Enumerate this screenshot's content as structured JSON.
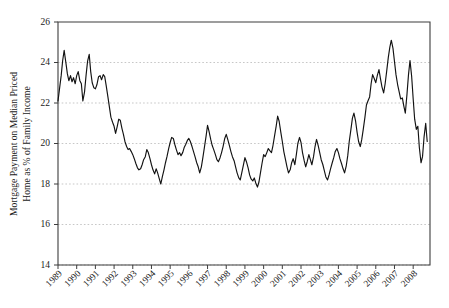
{
  "chart_data": {
    "type": "line",
    "title": "",
    "subtitle": "",
    "xlabel": "",
    "ylabel": "Mortgage Payment on Median Priced Home as % of Family Income",
    "ylabel_line1": "Mortgage Payment on Median Priced",
    "ylabel_line2": "Home as % of Family Income",
    "xlim": [
      1989.0,
      2008.9
    ],
    "ylim": [
      14,
      26
    ],
    "yticks": [
      14,
      16,
      18,
      20,
      22,
      24,
      26
    ],
    "ytick_labels": [
      "14",
      "16",
      "18",
      "20",
      "22",
      "24",
      "26"
    ],
    "xticks": [
      1989,
      1990,
      1991,
      1992,
      1993,
      1994,
      1995,
      1996,
      1997,
      1998,
      1999,
      2000,
      2001,
      2002,
      2003,
      2004,
      2005,
      2006,
      2007,
      2008
    ],
    "xtick_labels": [
      "1989",
      "1990",
      "1991",
      "1992",
      "1993",
      "1994",
      "1995",
      "1996",
      "1997",
      "1998",
      "1999",
      "2000",
      "2001",
      "2002",
      "2003",
      "2004",
      "2005",
      "2006",
      "2007",
      "2008"
    ],
    "grid": true,
    "grid_axis": "y",
    "legend": false,
    "legend_position": "none",
    "line_color": "#121212",
    "grid_color": "#b9b9b9",
    "axis_color": "#3d3d3d",
    "series": [
      {
        "name": "Mortgage Payment on Median Priced Home as % of Family Income",
        "x": [
          1989.0,
          1989.08,
          1989.17,
          1989.25,
          1989.33,
          1989.42,
          1989.5,
          1989.58,
          1989.67,
          1989.75,
          1989.83,
          1989.92,
          1990.0,
          1990.08,
          1990.17,
          1990.25,
          1990.33,
          1990.42,
          1990.5,
          1990.58,
          1990.67,
          1990.75,
          1990.83,
          1990.92,
          1991.0,
          1991.08,
          1991.17,
          1991.25,
          1991.33,
          1991.42,
          1991.5,
          1991.58,
          1991.67,
          1991.75,
          1991.83,
          1991.92,
          1992.0,
          1992.08,
          1992.17,
          1992.25,
          1992.33,
          1992.42,
          1992.5,
          1992.58,
          1992.67,
          1992.75,
          1992.83,
          1992.92,
          1993.0,
          1993.08,
          1993.17,
          1993.25,
          1993.33,
          1993.42,
          1993.5,
          1993.58,
          1993.67,
          1993.75,
          1993.83,
          1993.92,
          1994.0,
          1994.08,
          1994.17,
          1994.25,
          1994.33,
          1994.42,
          1994.5,
          1994.58,
          1994.67,
          1994.75,
          1994.83,
          1994.92,
          1995.0,
          1995.08,
          1995.17,
          1995.25,
          1995.33,
          1995.42,
          1995.5,
          1995.58,
          1995.67,
          1995.75,
          1995.83,
          1995.92,
          1996.0,
          1996.08,
          1996.17,
          1996.25,
          1996.33,
          1996.42,
          1996.5,
          1996.58,
          1996.67,
          1996.75,
          1996.83,
          1996.92,
          1997.0,
          1997.08,
          1997.17,
          1997.25,
          1997.33,
          1997.42,
          1997.5,
          1997.58,
          1997.67,
          1997.75,
          1997.83,
          1997.92,
          1998.0,
          1998.08,
          1998.17,
          1998.25,
          1998.33,
          1998.42,
          1998.5,
          1998.58,
          1998.67,
          1998.75,
          1998.83,
          1998.92,
          1999.0,
          1999.08,
          1999.17,
          1999.25,
          1999.33,
          1999.42,
          1999.5,
          1999.58,
          1999.67,
          1999.75,
          1999.83,
          1999.92,
          2000.0,
          2000.08,
          2000.17,
          2000.25,
          2000.33,
          2000.42,
          2000.5,
          2000.58,
          2000.67,
          2000.75,
          2000.83,
          2000.92,
          2001.0,
          2001.08,
          2001.17,
          2001.25,
          2001.33,
          2001.42,
          2001.5,
          2001.58,
          2001.67,
          2001.75,
          2001.83,
          2001.92,
          2002.0,
          2002.08,
          2002.17,
          2002.25,
          2002.33,
          2002.42,
          2002.5,
          2002.58,
          2002.67,
          2002.75,
          2002.83,
          2002.92,
          2003.0,
          2003.08,
          2003.17,
          2003.25,
          2003.33,
          2003.42,
          2003.5,
          2003.58,
          2003.67,
          2003.75,
          2003.83,
          2003.92,
          2004.0,
          2004.08,
          2004.17,
          2004.25,
          2004.33,
          2004.42,
          2004.5,
          2004.58,
          2004.67,
          2004.75,
          2004.83,
          2004.92,
          2005.0,
          2005.08,
          2005.17,
          2005.25,
          2005.33,
          2005.42,
          2005.5,
          2005.58,
          2005.67,
          2005.75,
          2005.83,
          2005.92,
          2006.0,
          2006.08,
          2006.17,
          2006.25,
          2006.33,
          2006.42,
          2006.5,
          2006.58,
          2006.67,
          2006.75,
          2006.83,
          2006.92,
          2007.0,
          2007.08,
          2007.17,
          2007.25,
          2007.33,
          2007.42,
          2007.5,
          2007.58,
          2007.67,
          2007.75,
          2007.83,
          2007.92,
          2008.0,
          2008.08,
          2008.17,
          2008.25,
          2008.33,
          2008.42,
          2008.5,
          2008.58,
          2008.67,
          2008.75
        ],
        "values": [
          22.1,
          22.7,
          23.35,
          24.1,
          24.6,
          24.0,
          23.45,
          23.1,
          23.35,
          23.05,
          23.25,
          22.95,
          23.35,
          23.55,
          23.1,
          22.95,
          22.1,
          22.55,
          23.35,
          24.05,
          24.4,
          23.55,
          23.0,
          22.75,
          22.7,
          22.9,
          23.3,
          23.35,
          23.15,
          23.4,
          23.3,
          22.85,
          22.3,
          21.8,
          21.3,
          21.05,
          20.85,
          20.5,
          20.85,
          21.2,
          21.15,
          20.75,
          20.45,
          20.1,
          19.85,
          19.7,
          19.75,
          19.6,
          19.45,
          19.25,
          19.0,
          18.8,
          18.7,
          18.75,
          18.95,
          19.2,
          19.35,
          19.7,
          19.55,
          19.25,
          18.95,
          18.7,
          18.5,
          18.75,
          18.55,
          18.25,
          18.0,
          18.35,
          18.7,
          19.05,
          19.35,
          19.75,
          20.05,
          20.3,
          20.25,
          19.95,
          19.7,
          19.45,
          19.55,
          19.4,
          19.55,
          19.8,
          19.95,
          20.15,
          20.25,
          20.1,
          19.85,
          19.6,
          19.35,
          19.05,
          18.85,
          18.55,
          18.85,
          19.3,
          19.8,
          20.35,
          20.9,
          20.6,
          20.2,
          19.9,
          19.7,
          19.45,
          19.2,
          19.1,
          19.3,
          19.55,
          19.85,
          20.25,
          20.45,
          20.2,
          19.9,
          19.6,
          19.35,
          19.15,
          18.85,
          18.55,
          18.3,
          18.2,
          18.55,
          18.95,
          19.3,
          19.1,
          18.8,
          18.45,
          18.25,
          18.15,
          18.3,
          18.05,
          17.85,
          18.1,
          18.55,
          19.05,
          19.45,
          19.35,
          19.55,
          19.75,
          19.65,
          19.55,
          19.9,
          20.35,
          20.85,
          21.35,
          21.1,
          20.55,
          20.1,
          19.6,
          19.2,
          18.85,
          18.55,
          18.7,
          19.05,
          19.25,
          18.95,
          19.45,
          20.0,
          20.3,
          20.05,
          19.55,
          19.15,
          18.85,
          19.1,
          19.45,
          19.2,
          18.95,
          19.35,
          19.85,
          20.2,
          19.9,
          19.55,
          19.2,
          18.95,
          18.65,
          18.35,
          18.2,
          18.45,
          18.75,
          19.05,
          19.3,
          19.6,
          19.75,
          19.55,
          19.25,
          19.0,
          18.75,
          18.55,
          18.9,
          19.4,
          20.1,
          20.7,
          21.25,
          21.5,
          21.1,
          20.55,
          20.1,
          19.85,
          20.2,
          20.7,
          21.3,
          21.9,
          22.1,
          22.3,
          22.95,
          23.4,
          23.2,
          23.0,
          23.35,
          23.65,
          23.2,
          22.8,
          22.5,
          22.95,
          23.55,
          24.25,
          24.75,
          25.1,
          24.7,
          24.05,
          23.4,
          22.9,
          22.55,
          22.2,
          22.25,
          21.85,
          21.5,
          22.45,
          23.4,
          24.1,
          23.3,
          22.2,
          21.2,
          20.7,
          20.85,
          19.8,
          19.05,
          19.35,
          20.3,
          21.0,
          20.1
        ]
      }
    ],
    "annotations": [],
    "summary": {
      "start_value": 22.1,
      "end_value": 15.7,
      "max_value": 25.1,
      "max_year": 2006,
      "min_value": 15.7,
      "min_year": 2008
    }
  }
}
